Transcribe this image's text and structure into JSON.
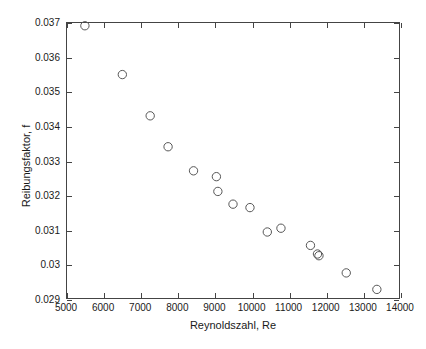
{
  "chart_data": {
    "type": "scatter",
    "title": "",
    "subtitle": "",
    "xlabel": "Reynoldszahl, Re",
    "ylabel": "Reibungsfaktor, f",
    "xlim": [
      5000,
      14000
    ],
    "ylim": [
      0.029,
      0.037
    ],
    "xticks": [
      5000,
      6000,
      7000,
      8000,
      9000,
      10000,
      11000,
      12000,
      13000,
      14000
    ],
    "xtick_labels": [
      "5000",
      "6000",
      "7000",
      "8000",
      "9000",
      "10000",
      "11000",
      "12000",
      "13000",
      "14000"
    ],
    "yticks": [
      0.029,
      0.03,
      0.031,
      0.032,
      0.033,
      0.034,
      0.035,
      0.036,
      0.037
    ],
    "ytick_labels": [
      "0.029",
      "0.03",
      "0.031",
      "0.032",
      "0.033",
      "0.034",
      "0.035",
      "0.036",
      "0.037"
    ],
    "grid": false,
    "legend": null,
    "marker": "open-circle",
    "marker_color": "#555555",
    "marker_size": 6,
    "series": [
      {
        "name": "Messpunkte",
        "x": [
          5485,
          6500,
          7255,
          7740,
          8430,
          9050,
          9090,
          9500,
          9960,
          10430,
          10800,
          11600,
          11790,
          11830,
          12570,
          13400
        ],
        "y": [
          0.03692,
          0.0355,
          0.0343,
          0.0334,
          0.0327,
          0.03253,
          0.0321,
          0.03173,
          0.03163,
          0.03092,
          0.03103,
          0.03053,
          0.03028,
          0.03023,
          0.02973,
          0.02925
        ]
      }
    ],
    "points": [
      {
        "x": 5485,
        "y": 0.03692
      },
      {
        "x": 6500,
        "y": 0.0355
      },
      {
        "x": 7255,
        "y": 0.0343
      },
      {
        "x": 7740,
        "y": 0.0334
      },
      {
        "x": 8430,
        "y": 0.0327
      },
      {
        "x": 9050,
        "y": 0.03253
      },
      {
        "x": 9090,
        "y": 0.0321
      },
      {
        "x": 9500,
        "y": 0.03173
      },
      {
        "x": 9960,
        "y": 0.03163
      },
      {
        "x": 10430,
        "y": 0.03092
      },
      {
        "x": 10800,
        "y": 0.03103
      },
      {
        "x": 11600,
        "y": 0.03053
      },
      {
        "x": 11790,
        "y": 0.03028
      },
      {
        "x": 11830,
        "y": 0.03023
      },
      {
        "x": 12570,
        "y": 0.02973
      },
      {
        "x": 13400,
        "y": 0.02925
      }
    ]
  }
}
